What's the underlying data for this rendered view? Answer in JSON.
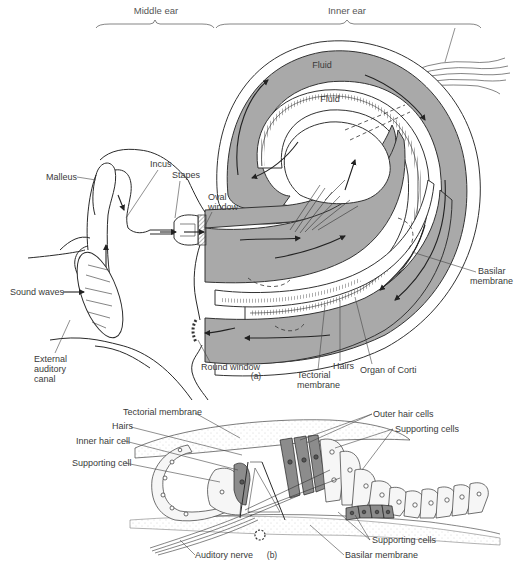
{
  "figure": {
    "panel_a": {
      "caption": "(a)",
      "section_headers": {
        "middle_ear": "Middle ear",
        "inner_ear": "Inner ear"
      },
      "fluid_labels": [
        "Fluid",
        "Fluid"
      ],
      "labels": {
        "malleus": "Malleus",
        "incus": "Incus",
        "stapes": "Stapes",
        "oval_window_1": "Oval",
        "oval_window_2": "window",
        "sound_waves": "Sound waves",
        "external_canal_1": "External",
        "external_canal_2": "auditory",
        "external_canal_3": "canal",
        "round_window": "Round window",
        "tectorial_1": "Tectorial",
        "tectorial_2": "membrane",
        "hairs": "Hairs",
        "organ_of_corti": "Organ of Corti",
        "basilar_1": "Basilar",
        "basilar_2": "membrane"
      }
    },
    "panel_b": {
      "caption": "(b)",
      "labels": {
        "tectorial_membrane": "Tectorial membrane",
        "hairs": "Hairs",
        "inner_hair_cell": "Inner hair cell",
        "supporting_cell": "Supporting cell",
        "outer_hair_cells": "Outer hair cells",
        "supporting_cells_top": "Supporting cells",
        "supporting_cells_bottom": "Supporting cells",
        "auditory_nerve": "Auditory nerve",
        "basilar_membrane": "Basilar membrane"
      }
    },
    "colors": {
      "fluid_fill": "#a9a9a9",
      "line": "#2a2a2a",
      "background": "#ffffff",
      "hair_cell_fill": "#8c8c8c"
    }
  }
}
